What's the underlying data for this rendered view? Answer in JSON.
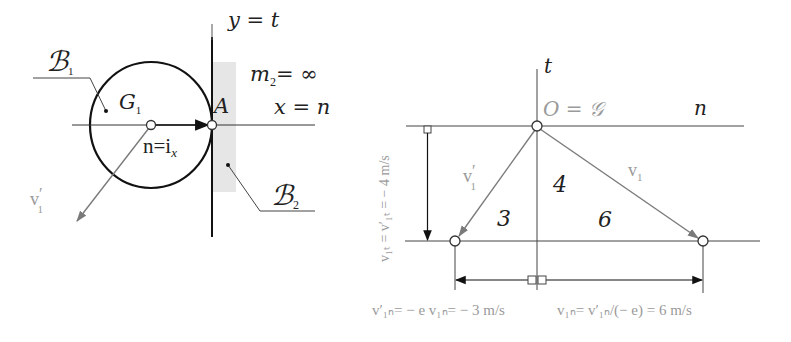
{
  "colors": {
    "ink": "#111111",
    "line": "#444444",
    "vector_gray": "#7a7a7a",
    "label_gray": "#9a9a9a",
    "wall_fill": "#e6e6e6"
  },
  "left_diagram": {
    "body1_label": "ℬ",
    "body1_sub": "1",
    "body2_label": "ℬ",
    "body2_sub": "2",
    "center_label": "G",
    "center_sub": "1",
    "contact_label": "A",
    "normal_label": "n=i",
    "normal_sub": "x",
    "y_axis_label": "y = t",
    "x_axis_label": "x = n",
    "mass_label": "m",
    "mass_sub": "2",
    "mass_value": "= ∞",
    "velocity_label": "v",
    "velocity_sub": "1",
    "velocity_prime": "′"
  },
  "right_diagram": {
    "t_axis_label": "t",
    "n_axis_label": "n",
    "origin_label": "O = 𝒢",
    "v1_prime_label": "v",
    "v1_prime_sub": "1",
    "v1_prime_mark": "′",
    "v1_label": "v",
    "v1_sub": "1",
    "segment_labels": [
      "3",
      "4",
      "6"
    ],
    "tangential_label": "v₁ₜ = v′₁ₜ = − 4 m/s",
    "left_bottom_label": "v′₁ₙ= − e v₁ₙ= − 3 m/s",
    "right_bottom_label": "v₁ₙ= v′₁ₙ/(− e) = 6 m/s"
  },
  "values": {
    "v1t": -4,
    "v1t_prime": -4,
    "v1n_prime": -3,
    "v1n": 6,
    "unit": "m/s"
  }
}
